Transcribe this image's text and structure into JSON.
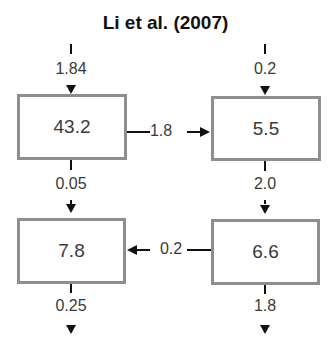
{
  "title": "Li et al. (2007)",
  "boxes": {
    "top_left": "43.2",
    "top_right": "5.5",
    "bottom_left": "7.8",
    "bottom_right": "6.6"
  },
  "flows": {
    "input_left": "1.84",
    "input_right": "0.2",
    "top_left_to_top_right": "1.8",
    "top_left_to_bottom_left": "0.05",
    "top_right_to_bottom_right": "2.0",
    "bottom_right_to_bottom_left": "0.2",
    "output_left": "0.25",
    "output_right": "1.8"
  },
  "colors": {
    "box_border": "#8e8e8e",
    "arrow": "#111111",
    "text": "#3a3a3a"
  }
}
